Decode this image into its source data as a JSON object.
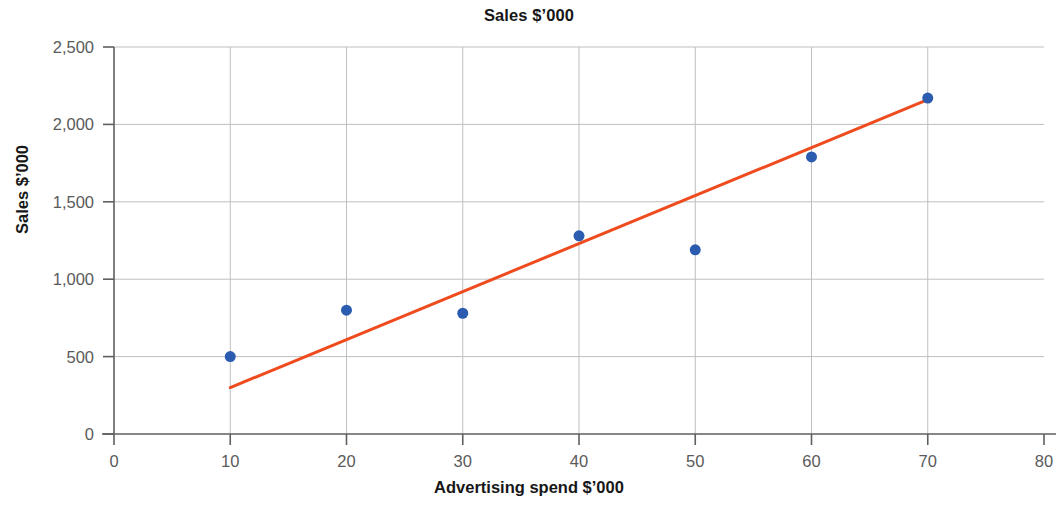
{
  "chart_data": {
    "type": "scatter",
    "title": "Sales $’000",
    "xlabel": "Advertising spend $’000",
    "ylabel": "Sales $’000",
    "xlim": [
      0,
      80
    ],
    "ylim": [
      0,
      2500
    ],
    "xticks": [
      0,
      10,
      20,
      30,
      40,
      50,
      60,
      70,
      80
    ],
    "yticks": [
      0,
      500,
      1000,
      1500,
      2000,
      2500
    ],
    "xtick_labels": [
      "0",
      "10",
      "20",
      "30",
      "40",
      "50",
      "60",
      "70",
      "80"
    ],
    "ytick_labels": [
      "0",
      "500",
      "1,000",
      "1,500",
      "2,000",
      "2,500"
    ],
    "grid": "horizontal-and-vertical",
    "legend": "none",
    "series": [
      {
        "name": "Sales observations",
        "type": "scatter",
        "marker_color": "#2B5CAF",
        "marker_size": 11,
        "points": [
          {
            "x": 10,
            "y": 500
          },
          {
            "x": 20,
            "y": 800
          },
          {
            "x": 30,
            "y": 780
          },
          {
            "x": 40,
            "y": 1280
          },
          {
            "x": 50,
            "y": 1190
          },
          {
            "x": 60,
            "y": 1790
          },
          {
            "x": 70,
            "y": 2170
          }
        ]
      },
      {
        "name": "Trend line",
        "type": "line",
        "line_color": "#EE4B1E",
        "line_width": 3,
        "points": [
          {
            "x": 10,
            "y": 300
          },
          {
            "x": 70,
            "y": 2160
          }
        ]
      }
    ],
    "colors": {
      "marker": "#2B5CAF",
      "trendline": "#EE4B1E",
      "gridline": "#BFBFBF",
      "axis": "#5F5F5F",
      "tick_text": "#5A5A5A",
      "title_text": "#171717",
      "background": "#FFFFFF"
    }
  }
}
